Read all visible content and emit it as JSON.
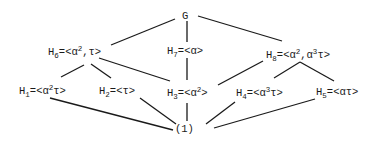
{
  "diagram": {
    "type": "subgroup-lattice",
    "nodes": [
      {
        "id": "G",
        "name": "G",
        "sub": "",
        "eq": "",
        "gen": []
      },
      {
        "id": "H6",
        "name": "H",
        "sub": "6",
        "eq": "=",
        "gen": [
          {
            "t": "<α"
          },
          {
            "sup": "2"
          },
          {
            "t": ",τ>"
          }
        ]
      },
      {
        "id": "H7",
        "name": "H",
        "sub": "7",
        "eq": "=",
        "gen": [
          {
            "t": "<α>"
          }
        ]
      },
      {
        "id": "H8",
        "name": "H",
        "sub": "8",
        "eq": "=",
        "gen": [
          {
            "t": "<α"
          },
          {
            "sup": "2"
          },
          {
            "t": ",α"
          },
          {
            "sup": "3"
          },
          {
            "t": "τ>"
          }
        ]
      },
      {
        "id": "H1",
        "name": "H",
        "sub": "1",
        "eq": "=",
        "gen": [
          {
            "t": "<α"
          },
          {
            "sup": "2"
          },
          {
            "t": "τ>"
          }
        ]
      },
      {
        "id": "H2",
        "name": "H",
        "sub": "2",
        "eq": "=",
        "gen": [
          {
            "t": "<τ>"
          }
        ]
      },
      {
        "id": "H3",
        "name": "H",
        "sub": "3",
        "eq": "=",
        "gen": [
          {
            "t": "<α"
          },
          {
            "sup": "2"
          },
          {
            "t": ">"
          }
        ]
      },
      {
        "id": "H4",
        "name": "H",
        "sub": "4",
        "eq": "=",
        "gen": [
          {
            "t": "<α"
          },
          {
            "sup": "3"
          },
          {
            "t": "τ>"
          }
        ]
      },
      {
        "id": "H5",
        "name": "H",
        "sub": "5",
        "eq": "=",
        "gen": [
          {
            "t": "<ατ>"
          }
        ]
      },
      {
        "id": "one",
        "name": "(1)",
        "sub": "",
        "eq": "",
        "gen": []
      }
    ],
    "labels": {
      "G": "G",
      "H6": {
        "h": "H",
        "sub": "6",
        "rest1": "=<α",
        "sup": "2",
        "rest2": ",τ>"
      },
      "H7": {
        "h": "H",
        "sub": "7",
        "rest1": "=<α>"
      },
      "H8": {
        "h": "H",
        "sub": "8",
        "rest1": "=<α",
        "sup1": "2",
        "rest2": ",α",
        "sup2": "3",
        "rest3": "τ>"
      },
      "H1": {
        "h": "H",
        "sub": "1",
        "rest1": "=<α",
        "sup": "2",
        "rest2": "τ>"
      },
      "H2": {
        "h": "H",
        "sub": "2",
        "rest1": "=<τ>"
      },
      "H3": {
        "h": "H",
        "sub": "3",
        "rest1": "=<α",
        "sup": "2",
        "rest2": ">"
      },
      "H4": {
        "h": "H",
        "sub": "4",
        "rest1": "=<α",
        "sup": "3",
        "rest2": "τ>"
      },
      "H5": {
        "h": "H",
        "sub": "5",
        "rest1": "=<ατ>"
      },
      "one": "(1)"
    },
    "edges": [
      [
        "G",
        "H6"
      ],
      [
        "G",
        "H7"
      ],
      [
        "G",
        "H8"
      ],
      [
        "H6",
        "H1"
      ],
      [
        "H6",
        "H2"
      ],
      [
        "H6",
        "H3"
      ],
      [
        "H7",
        "H3"
      ],
      [
        "H8",
        "H3"
      ],
      [
        "H8",
        "H4"
      ],
      [
        "H8",
        "H5"
      ],
      [
        "H1",
        "one"
      ],
      [
        "H2",
        "one"
      ],
      [
        "H3",
        "one"
      ],
      [
        "H4",
        "one"
      ],
      [
        "H5",
        "one"
      ]
    ]
  }
}
